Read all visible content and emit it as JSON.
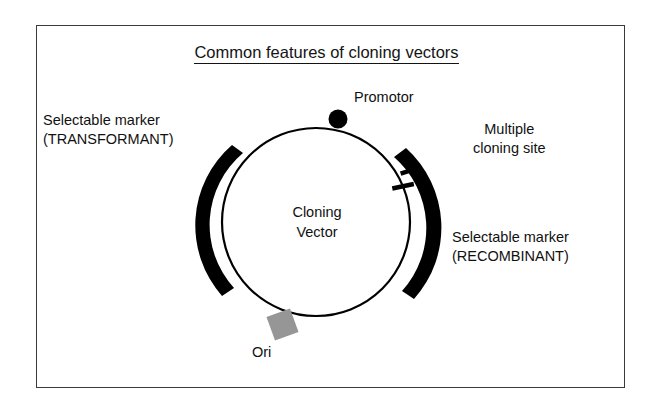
{
  "figure": {
    "title": "Common features of cloning vectors",
    "center_label_line1": "Cloning",
    "center_label_line2": "Vector",
    "labels": {
      "selectable_marker_transformant_line1": "Selectable marker",
      "selectable_marker_transformant_line2": "(TRANSFORMANT)",
      "multiple_cloning_site_line1": "Multiple",
      "multiple_cloning_site_line2": "cloning site",
      "selectable_marker_recombinant_line1": "Selectable marker",
      "selectable_marker_recombinant_line2": "(RECOMBINANT)",
      "promotor": "Promotor",
      "ori": "Ori"
    },
    "colors": {
      "background": "#ffffff",
      "frame_border": "#3a3a3a",
      "plasmid_ring": "#000000",
      "gene_arc": "#000000",
      "promotor_dot": "#000000",
      "ori_box": "#969696",
      "text": "#111111"
    },
    "geometry": {
      "plasmid_center_x": 316,
      "plasmid_center_y": 222,
      "plasmid_radius": 94,
      "promotor_dot_radius": 9,
      "arc_thickness": 13,
      "restriction_site_ticks": 2
    }
  }
}
